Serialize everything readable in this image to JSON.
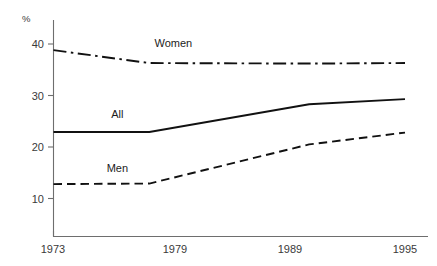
{
  "chart_data": {
    "type": "line",
    "title": "",
    "subtitle": "",
    "xlabel": "",
    "ylabel": "%",
    "x": [
      1973,
      1979,
      1989,
      1995
    ],
    "xticklabels": [
      "1973",
      "1979",
      "1989",
      "1995"
    ],
    "yticks": [
      10,
      20,
      30,
      40
    ],
    "yticklabels": [
      "10",
      "20",
      "30",
      "40"
    ],
    "ylim": [
      4,
      43
    ],
    "xlim": [
      1973,
      1995
    ],
    "grid": false,
    "legend": "inline-labels",
    "series": [
      {
        "name": "Women",
        "label": "Women",
        "style": "dash-dot",
        "color": "#111111",
        "values": [
          38.8,
          36.3,
          36.2,
          36.3
        ]
      },
      {
        "name": "All",
        "label": "All",
        "style": "solid",
        "color": "#111111",
        "values": [
          22.9,
          22.9,
          28.3,
          29.3
        ]
      },
      {
        "name": "Men",
        "label": "Men",
        "style": "dashed",
        "color": "#111111",
        "values": [
          12.8,
          12.9,
          20.5,
          22.8
        ]
      }
    ],
    "annotations": [
      {
        "text": "Women",
        "x": 1980.5,
        "y": 39.5
      },
      {
        "text": "All",
        "x": 1977.0,
        "y": 25.6
      },
      {
        "text": "Men",
        "x": 1977.0,
        "y": 15.2
      }
    ]
  }
}
